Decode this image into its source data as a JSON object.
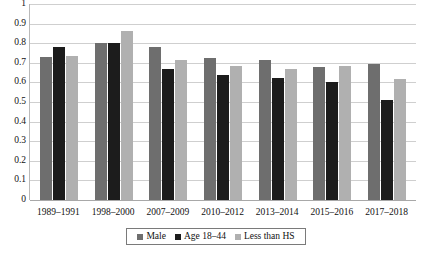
{
  "chart_data": {
    "type": "bar",
    "title": "",
    "subtitle": "",
    "xlabel": "",
    "ylabel": "",
    "ylim": [
      0,
      1
    ],
    "ytick_labels": [
      "1",
      "0.9",
      "0.8",
      "0.7",
      "0.6",
      "0.5",
      "0.4",
      "0.3",
      "0.2",
      "0.1",
      "0"
    ],
    "ytick_values": [
      1,
      0.9,
      0.8,
      0.7,
      0.6,
      0.5,
      0.4,
      0.3,
      0.2,
      0.1,
      0
    ],
    "grid": true,
    "legend_position": "bottom",
    "categories": [
      "1989–1991",
      "1998–2000",
      "2007–2009",
      "2010–2012",
      "2013–2014",
      "2015–2016",
      "2017–2018"
    ],
    "series": [
      {
        "name": "Male",
        "color": "#6e6e6e",
        "values": [
          0.73,
          0.8,
          0.78,
          0.725,
          0.715,
          0.68,
          0.695
        ]
      },
      {
        "name": "Age 18–44",
        "color": "#1c1c1c",
        "values": [
          0.78,
          0.8,
          0.67,
          0.64,
          0.62,
          0.6,
          0.51
        ]
      },
      {
        "name": "Less than HS",
        "color": "#b0b0b0",
        "values": [
          0.735,
          0.86,
          0.715,
          0.685,
          0.67,
          0.685,
          0.615
        ]
      }
    ]
  },
  "colors": {
    "series_male": "#6e6e6e",
    "series_age": "#1c1c1c",
    "series_hs": "#b0b0b0",
    "gridline": "#cfcfcf",
    "axis": "#a8a8a8",
    "legend_border": "#7a7a7a",
    "background": "#ffffff"
  }
}
